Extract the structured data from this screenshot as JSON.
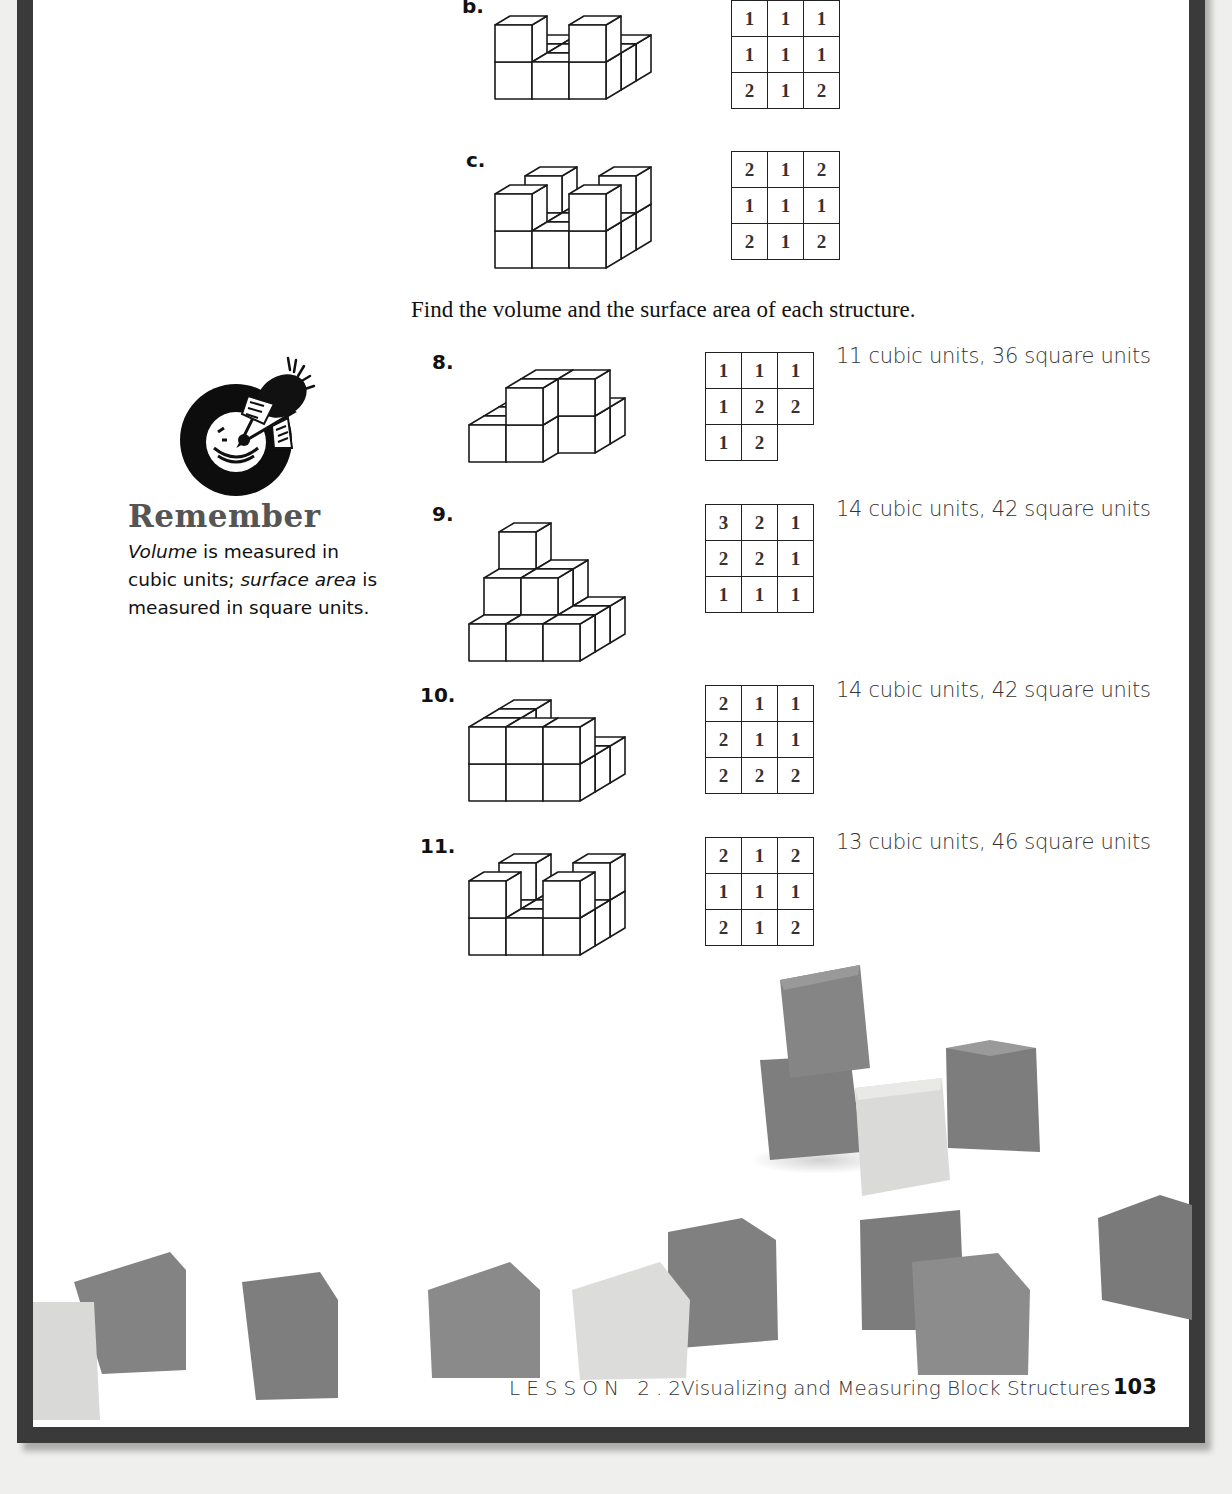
{
  "instruction": "Find the volume and the surface area of each structure.",
  "examples": [
    {
      "label": "b.",
      "heights": [
        [
          1,
          1,
          1
        ],
        [
          1,
          1,
          1
        ],
        [
          2,
          1,
          2
        ]
      ]
    },
    {
      "label": "c.",
      "heights": [
        [
          2,
          1,
          2
        ],
        [
          1,
          1,
          1
        ],
        [
          2,
          1,
          2
        ]
      ]
    }
  ],
  "exercises": [
    {
      "label": "8.",
      "heights": [
        [
          1,
          1,
          1
        ],
        [
          1,
          2,
          2
        ],
        [
          1,
          2,
          0
        ]
      ],
      "answer": "11 cubic units, 36 square units"
    },
    {
      "label": "9.",
      "heights": [
        [
          3,
          2,
          1
        ],
        [
          2,
          2,
          1
        ],
        [
          1,
          1,
          1
        ]
      ],
      "answer": "14 cubic units, 42 square units"
    },
    {
      "label": "10.",
      "heights": [
        [
          2,
          1,
          1
        ],
        [
          2,
          1,
          1
        ],
        [
          2,
          2,
          2
        ]
      ],
      "answer": "14 cubic units, 42 square units"
    },
    {
      "label": "11.",
      "heights": [
        [
          2,
          1,
          2
        ],
        [
          1,
          1,
          1
        ],
        [
          2,
          1,
          2
        ]
      ],
      "answer": "13 cubic units, 46 square units"
    }
  ],
  "remember": {
    "icon": "megaphone-icon",
    "title": "Remember",
    "term1": "Volume",
    "text1": " is measured in cubic units; ",
    "term2": "surface area",
    "text2": " is measured in square units."
  },
  "footer": {
    "lesson": "LESSON 2.2",
    "title": "Visualizing and Measuring Block Structures",
    "page": "103"
  },
  "colors": {
    "border": "#3a3a3a",
    "cube_dark": "#8a8a8a",
    "cube_light": "#e6e6e4"
  }
}
